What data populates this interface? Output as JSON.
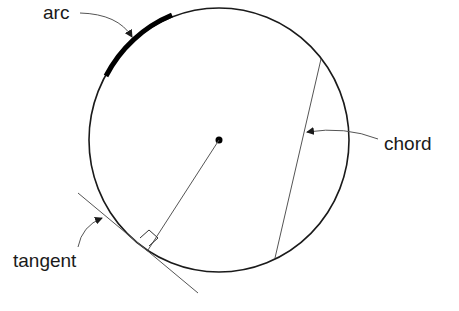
{
  "diagram": {
    "labels": {
      "arc": "arc",
      "chord": "chord",
      "tangent": "tangent"
    },
    "elements": [
      "circle",
      "center-point",
      "radius",
      "arc",
      "chord",
      "tangent-line",
      "right-angle-marker"
    ],
    "colors": {
      "stroke": "#1a1a1a",
      "thin_stroke": "#555555",
      "background": "#ffffff"
    }
  }
}
